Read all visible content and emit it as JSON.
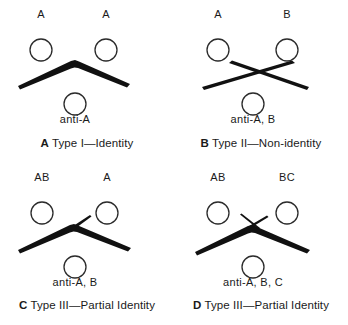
{
  "figure": {
    "ink_color": "#111111",
    "background_color": "#ffffff",
    "well_stroke_color": "#2b2b2b"
  },
  "panels": [
    {
      "id": "A",
      "pattern": "continuous-arc",
      "caption_letter": "A",
      "caption_text": "Type I—Identity",
      "top_left_well": {
        "label": "A",
        "cx": 41,
        "cy": 50,
        "r": 11
      },
      "top_right_well": {
        "label": "A",
        "cx": 106,
        "cy": 50,
        "r": 11
      },
      "bottom_well": {
        "label": "anti-A",
        "cx": 75,
        "cy": 104,
        "r": 11
      },
      "top_left_label_pos": {
        "x": 41,
        "y": 14
      },
      "top_right_label_pos": {
        "x": 106,
        "y": 14
      },
      "bottom_label_pos": {
        "x": 75,
        "y": 118
      },
      "spur": "none"
    },
    {
      "id": "B",
      "pattern": "crossed-lines",
      "caption_letter": "B",
      "caption_text": "Type II—Non-identity",
      "top_left_well": {
        "label": "A",
        "cx": 44,
        "cy": 50,
        "r": 11
      },
      "top_right_well": {
        "label": "B",
        "cx": 113,
        "cy": 50,
        "r": 11
      },
      "bottom_well": {
        "label": "anti-A, B",
        "cx": 79,
        "cy": 104,
        "r": 11
      },
      "top_left_label_pos": {
        "x": 44,
        "y": 14
      },
      "top_right_label_pos": {
        "x": 113,
        "y": 14
      },
      "bottom_label_pos": {
        "x": 79,
        "y": 118
      },
      "spur": "full-cross"
    },
    {
      "id": "C",
      "pattern": "arc-with-single-spur",
      "caption_letter": "C",
      "caption_text": "Type III—Partial Identity",
      "top_left_well": {
        "label": "AB",
        "cx": 42,
        "cy": 51,
        "r": 11
      },
      "top_right_well": {
        "label": "A",
        "cx": 107,
        "cy": 51,
        "r": 11
      },
      "bottom_well": {
        "label": "anti-A, B",
        "cx": 75,
        "cy": 105,
        "r": 11
      },
      "top_left_label_pos": {
        "x": 42,
        "y": 15
      },
      "top_right_label_pos": {
        "x": 107,
        "y": 15
      },
      "bottom_label_pos": {
        "x": 75,
        "y": 119
      },
      "spur": "single-spur-up-right"
    },
    {
      "id": "D",
      "pattern": "arc-with-crossed-spurs",
      "caption_letter": "D",
      "caption_text": "Type III—Partial Identity",
      "top_left_well": {
        "label": "AB",
        "cx": 44,
        "cy": 51,
        "r": 11
      },
      "top_right_well": {
        "label": "BC",
        "cx": 113,
        "cy": 51,
        "r": 11
      },
      "bottom_well": {
        "label": "anti-A, B, C",
        "cx": 79,
        "cy": 105,
        "r": 11
      },
      "top_left_label_pos": {
        "x": 44,
        "y": 15
      },
      "top_right_label_pos": {
        "x": 113,
        "y": 15
      },
      "bottom_label_pos": {
        "x": 79,
        "y": 119
      },
      "spur": "double-spur-cross"
    }
  ]
}
